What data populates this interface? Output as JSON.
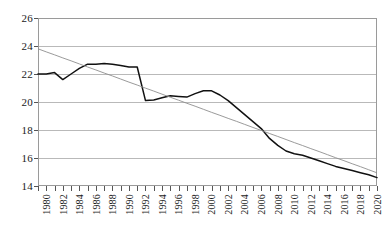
{
  "chart_data": {
    "type": "line",
    "title": "",
    "subtitle": "",
    "xlabel": "",
    "ylabel": "",
    "xlim": [
      1980,
      2021
    ],
    "ylim": [
      14,
      26
    ],
    "yticks": [
      14,
      16,
      18,
      20,
      22,
      24,
      26
    ],
    "xticks": [
      1980,
      1982,
      1984,
      1986,
      1988,
      1990,
      1992,
      1994,
      1996,
      1998,
      2000,
      2002,
      2004,
      2006,
      2008,
      2010,
      2012,
      2014,
      2016,
      2018,
      2020
    ],
    "xtick_labels": [
      "1980",
      "1982",
      "1984",
      "1986",
      "1988",
      "1990",
      "1992",
      "1994",
      "1996",
      "1998",
      "2000",
      "2002",
      "2004",
      "2006",
      "2008",
      "2010",
      "2012",
      "2014",
      "2016",
      "2018",
      "2020"
    ],
    "xtick_label_rotation": 90,
    "grid": "horizontal",
    "legend": "none",
    "x": [
      1980,
      1981,
      1982,
      1983,
      1984,
      1985,
      1986,
      1987,
      1988,
      1989,
      1990,
      1991,
      1992,
      1993,
      1994,
      1995,
      1996,
      1997,
      1998,
      1999,
      2000,
      2001,
      2002,
      2003,
      2004,
      2005,
      2006,
      2007,
      2008,
      2009,
      2010,
      2011,
      2012,
      2013,
      2014,
      2015,
      2016,
      2017,
      2018,
      2019,
      2020,
      2021
    ],
    "series": [
      {
        "name": "observed",
        "color": "#111111",
        "style": "solid",
        "values": [
          22.0,
          22.0,
          22.1,
          21.6,
          22.0,
          22.4,
          22.7,
          22.7,
          22.75,
          22.7,
          22.6,
          22.5,
          22.5,
          20.1,
          20.15,
          20.3,
          20.45,
          20.4,
          20.35,
          20.6,
          20.8,
          20.8,
          20.5,
          20.1,
          19.6,
          19.1,
          18.6,
          18.1,
          17.4,
          16.9,
          16.5,
          16.3,
          16.2,
          16.0,
          15.8,
          15.6,
          15.4,
          15.25,
          15.1,
          14.95,
          14.8,
          14.6
        ]
      },
      {
        "name": "linear trend",
        "color": "#8e8e8e",
        "style": "solid",
        "values": [
          23.8,
          23.58,
          23.37,
          23.15,
          22.94,
          22.72,
          22.5,
          22.29,
          22.07,
          21.86,
          21.64,
          21.42,
          21.21,
          20.99,
          20.78,
          20.56,
          20.34,
          20.13,
          19.91,
          19.7,
          19.48,
          19.26,
          19.05,
          18.83,
          18.62,
          18.4,
          18.18,
          17.97,
          17.75,
          17.54,
          17.32,
          17.1,
          16.89,
          16.67,
          16.46,
          16.24,
          16.02,
          15.81,
          15.59,
          15.38,
          15.16,
          14.94
        ]
      }
    ]
  },
  "caption": {
    "text": ""
  }
}
